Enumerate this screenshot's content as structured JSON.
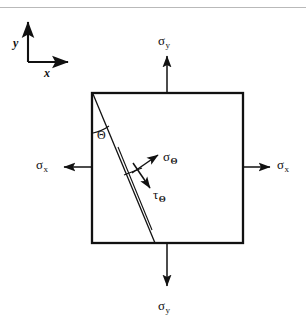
{
  "figure": {
    "type": "stress-element-diagram",
    "background_color": "#ffffff",
    "line_color": "#111111",
    "rule_color": "#b9b9b9"
  },
  "axes": {
    "y_label": "y",
    "x_label": "x",
    "origin": {
      "x": 28,
      "y": 62
    },
    "y_arrow_tip": {
      "x": 28,
      "y": 18
    },
    "x_arrow_tip": {
      "x": 72,
      "y": 62
    }
  },
  "element": {
    "name": "square-element",
    "left": 92,
    "top": 93,
    "right": 243,
    "bottom": 243
  },
  "cut_plane": {
    "name": "inclined-plane",
    "start": {
      "x": 93,
      "y": 94
    },
    "end": {
      "x": 155,
      "y": 243
    },
    "angle_from_vertical_deg": 22
  },
  "labels": {
    "sigma_y_top": {
      "symbol": "σ",
      "subscript": "y"
    },
    "sigma_y_bottom": {
      "symbol": "σ",
      "subscript": "y"
    },
    "sigma_x_left": {
      "symbol": "σ",
      "subscript": "x"
    },
    "sigma_x_right": {
      "symbol": "σ",
      "subscript": "x"
    },
    "sigma_theta": {
      "symbol": "σ",
      "subscript": "Θ"
    },
    "tau_theta": {
      "symbol": "τ",
      "subscript": "Θ"
    },
    "theta_angle": {
      "symbol": "Θ"
    }
  },
  "arrows": {
    "sigma_y_top": {
      "from": {
        "x": 167,
        "y": 93
      },
      "to": {
        "x": 167,
        "y": 52
      },
      "direction": "up"
    },
    "sigma_y_bottom": {
      "from": {
        "x": 167,
        "y": 243
      },
      "to": {
        "x": 167,
        "y": 290
      },
      "direction": "down"
    },
    "sigma_x_left": {
      "from": {
        "x": 92,
        "y": 167
      },
      "to": {
        "x": 60,
        "y": 167
      },
      "direction": "left"
    },
    "sigma_x_right": {
      "from": {
        "x": 243,
        "y": 167
      },
      "to": {
        "x": 274,
        "y": 167
      },
      "direction": "right"
    },
    "sigma_theta": {
      "from": {
        "x": 132,
        "y": 173
      },
      "to": {
        "x": 161,
        "y": 153
      },
      "direction": "up-right"
    },
    "tau_theta": {
      "from": {
        "x": 133,
        "y": 163
      },
      "to": {
        "x": 152,
        "y": 191
      },
      "direction": "down-right"
    }
  }
}
